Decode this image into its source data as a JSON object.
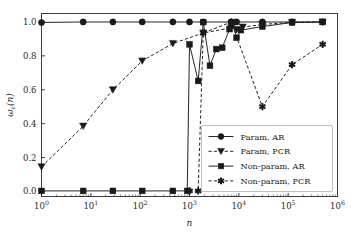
{
  "chart_data": {
    "type": "line",
    "title": "",
    "xlabel": "n",
    "ylabel": "ωε(n)",
    "xscale": "log",
    "xlim": [
      1,
      1000000
    ],
    "ylim": [
      -0.03,
      1.05
    ],
    "grid": false,
    "legend_position": "lower right",
    "xtick_labels": [
      "10^0",
      "10^1",
      "10^2",
      "10^3",
      "10^4",
      "10^5",
      "10^6"
    ],
    "xtick_mantissas": [
      "10",
      "10",
      "10",
      "10",
      "10",
      "10",
      "10"
    ],
    "xtick_exponents": [
      "0",
      "1",
      "2",
      "3",
      "4",
      "5",
      "6"
    ],
    "xtick_values": [
      1,
      10,
      100,
      1000,
      10000,
      100000,
      1000000
    ],
    "ytick_labels": [
      "0.0",
      "0.2",
      "0.4",
      "0.6",
      "0.8",
      "1.0"
    ],
    "ytick_values": [
      0.0,
      0.2,
      0.4,
      0.6,
      0.8,
      1.0
    ],
    "series": [
      {
        "name": "Param, AR",
        "marker": "circle",
        "linestyle": "solid",
        "color": "#1a1a1a",
        "x": [
          1,
          7,
          28,
          110,
          460,
          1000,
          1900,
          7000,
          9000,
          30000,
          120000,
          500000
        ],
        "y": [
          0.997,
          1.0,
          1.0,
          1.0,
          1.0,
          1.0,
          1.0,
          1.0,
          1.0,
          1.0,
          1.0,
          1.0
        ]
      },
      {
        "name": "Param, PCR",
        "marker": "triangle_down",
        "linestyle": "dashed",
        "color": "#1a1a1a",
        "x": [
          1,
          7,
          28,
          110,
          460,
          1900,
          7000,
          9000,
          12000,
          30000,
          120000,
          500000
        ],
        "y": [
          0.145,
          0.385,
          0.6,
          0.77,
          0.873,
          0.935,
          0.965,
          0.955,
          0.97,
          0.985,
          0.998,
          1.0
        ]
      },
      {
        "name": "Non-param, AR",
        "marker": "square",
        "linestyle": "solid",
        "color": "#1a1a1a",
        "x": [
          1,
          7,
          28,
          110,
          460,
          900,
          1000,
          1500,
          1900,
          2600,
          3500,
          4600,
          6500,
          7500,
          9000,
          11000,
          30000,
          120000,
          500000
        ],
        "y": [
          0.003,
          0.003,
          0.003,
          0.003,
          0.003,
          0.003,
          0.868,
          0.652,
          0.999,
          0.742,
          0.84,
          0.848,
          0.958,
          0.999,
          0.907,
          0.952,
          0.973,
          0.997,
          1.0
        ]
      },
      {
        "name": "Non-param, PCR",
        "marker": "star",
        "linestyle": "dashed",
        "color": "#1a1a1a",
        "x": [
          1000,
          1500,
          1900,
          7000,
          30000,
          120000,
          500000
        ],
        "y": [
          0.003,
          0.003,
          0.935,
          0.999,
          0.5,
          0.748,
          0.868
        ]
      }
    ],
    "legend_entries": [
      {
        "label": "Param, AR",
        "marker": "circle",
        "linestyle": "solid"
      },
      {
        "label": "Param, PCR",
        "marker": "triangle_down",
        "linestyle": "dashed"
      },
      {
        "label": "Non-param, AR",
        "marker": "square",
        "linestyle": "solid"
      },
      {
        "label": "Non-param, PCR",
        "marker": "star",
        "linestyle": "dashed"
      }
    ]
  },
  "axis": {
    "y_label_omega": "ω",
    "y_label_sub": "ε",
    "y_label_arg": "(n)",
    "x_label": "n"
  },
  "colors": {
    "line": "#1a1a1a",
    "axis": "#2b2b2b",
    "background": "#ffffff",
    "legend_border": "#b0b0b0"
  }
}
